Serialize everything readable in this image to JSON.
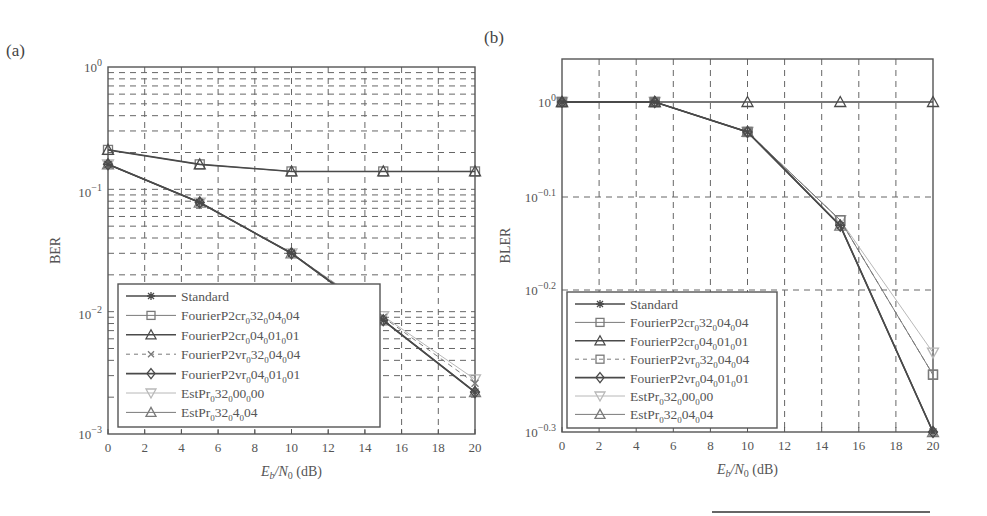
{
  "figure": {
    "panel_a_label": "(a)",
    "panel_b_label": "(b)",
    "bottom_rule": true
  },
  "chart_data": [
    {
      "type": "line",
      "panel": "(a)",
      "title": "",
      "xlabel": "E_b/N_0 (dB)",
      "xlabel_parts": {
        "E": "E",
        "b": "b",
        "slash": "/N",
        "zero": "0",
        "unit": " (dB)"
      },
      "ylabel": "BER",
      "yscale": "log",
      "ylim": [
        0.001,
        1
      ],
      "xlim": [
        0,
        20
      ],
      "x_ticks": [
        "0",
        "2",
        "4",
        "6",
        "8",
        "10",
        "12",
        "14",
        "16",
        "18",
        "20"
      ],
      "y_ticks": [
        {
          "base": "10",
          "exp": "0"
        },
        {
          "base": "10",
          "exp": "−1"
        },
        {
          "base": "10",
          "exp": "−2"
        },
        {
          "base": "10",
          "exp": "−3"
        }
      ],
      "grid": true,
      "legend_position": "lower left",
      "x": [
        0,
        5,
        10,
        15,
        20
      ],
      "series": [
        {
          "name": "Standard",
          "values": [
            0.16,
            0.078,
            0.03,
            0.0085,
            0.0022
          ]
        },
        {
          "name": "FourierP2cr_0 32_0 04_0 04",
          "values": [
            0.21,
            0.16,
            0.14,
            0.14,
            0.14
          ]
        },
        {
          "name": "FourierP2cr_0 04_0 01_0 01",
          "values": [
            0.21,
            0.16,
            0.14,
            0.14,
            0.14
          ]
        },
        {
          "name": "FourierP2vr_0 32_0 04_0 04",
          "values": [
            0.16,
            0.078,
            0.03,
            0.009,
            0.0026
          ]
        },
        {
          "name": "FourierP2vr_0 04_0 01_0 01",
          "values": [
            0.16,
            0.078,
            0.03,
            0.0085,
            0.0022
          ]
        },
        {
          "name": "EstPr_0 32_0 00_0 00",
          "values": [
            0.16,
            0.078,
            0.03,
            0.0092,
            0.0028
          ]
        },
        {
          "name": "EstPr_0 32_0 4_0 04",
          "values": [
            0.16,
            0.078,
            0.03,
            0.0085,
            0.0022
          ]
        }
      ],
      "legend": [
        {
          "main": "Standard",
          "parts": []
        },
        {
          "main": "FourierP2cr",
          "parts": [
            "32",
            "04",
            "04"
          ]
        },
        {
          "main": "FourierP2cr",
          "parts": [
            "04",
            "01",
            "01"
          ]
        },
        {
          "main": "FourierP2vr",
          "parts": [
            "32",
            "04",
            "04"
          ]
        },
        {
          "main": "FourierP2vr",
          "parts": [
            "04",
            "01",
            "01"
          ]
        },
        {
          "main": "EstPr",
          "parts": [
            "32",
            "00",
            "00"
          ]
        },
        {
          "main": "EstPr",
          "parts": [
            "32",
            "4",
            "04"
          ]
        }
      ]
    },
    {
      "type": "line",
      "panel": "(b)",
      "title": "",
      "xlabel": "E_b/N_0 (dB)",
      "xlabel_parts": {
        "E": "E",
        "b": "b",
        "slash": "/N",
        "zero": "0",
        "unit": " (dB)"
      },
      "ylabel": "BLER",
      "yscale": "log",
      "ylim": [
        0.5,
        1.25
      ],
      "xlim": [
        0,
        20
      ],
      "x_ticks": [
        "0",
        "2",
        "4",
        "6",
        "8",
        "10",
        "12",
        "14",
        "16",
        "18",
        "20"
      ],
      "y_ticks": [
        {
          "base": "10",
          "exp": "0"
        },
        {
          "base": "10",
          "exp": "−0.1"
        },
        {
          "base": "10",
          "exp": "−0.2"
        },
        {
          "base": "10",
          "exp": "−0.3"
        }
      ],
      "grid": true,
      "legend_position": "lower left",
      "x": [
        0,
        5,
        10,
        15,
        20
      ],
      "series": [
        {
          "name": "Standard",
          "values": [
            1.0,
            1.0,
            0.93,
            0.74,
            0.5
          ]
        },
        {
          "name": "FourierP2cr_0 32_0 04_0 04",
          "values": [
            1.0,
            1.0,
            0.93,
            0.75,
            0.55
          ]
        },
        {
          "name": "FourierP2cr_0 04_0 01_0 01",
          "values": [
            1.0,
            1.0,
            1.0,
            1.0,
            1.0
          ]
        },
        {
          "name": "FourierP2vr_0 32_0 04_0 04",
          "values": [
            1.0,
            1.0,
            0.93,
            0.75,
            0.55
          ]
        },
        {
          "name": "FourierP2vr_0 04_0 01_0 01",
          "values": [
            1.0,
            1.0,
            0.93,
            0.74,
            0.5
          ]
        },
        {
          "name": "EstPr_0 32_0 00_0 00",
          "values": [
            1.0,
            1.0,
            0.93,
            0.75,
            0.57
          ]
        },
        {
          "name": "EstPr_0 32_0 04_0 04",
          "values": [
            1.0,
            1.0,
            0.93,
            0.74,
            0.5
          ]
        }
      ],
      "legend": [
        {
          "main": "Standard",
          "parts": []
        },
        {
          "main": "FourierP2cr",
          "parts": [
            "32",
            "04",
            "04"
          ]
        },
        {
          "main": "FourierP2cr",
          "parts": [
            "04",
            "01",
            "01"
          ]
        },
        {
          "main": "FourierP2vr",
          "parts": [
            "32",
            "04",
            "04"
          ]
        },
        {
          "main": "FourierP2vr",
          "parts": [
            "04",
            "01",
            "01"
          ]
        },
        {
          "main": "EstPr",
          "parts": [
            "32",
            "00",
            "00"
          ]
        },
        {
          "main": "EstPr",
          "parts": [
            "32",
            "04",
            "04"
          ]
        }
      ]
    }
  ],
  "style": {
    "dark": "#4a4a4a",
    "mid": "#7a7a7a",
    "light": "#b8b8b8",
    "marker_fill": "#8a8a8a"
  }
}
